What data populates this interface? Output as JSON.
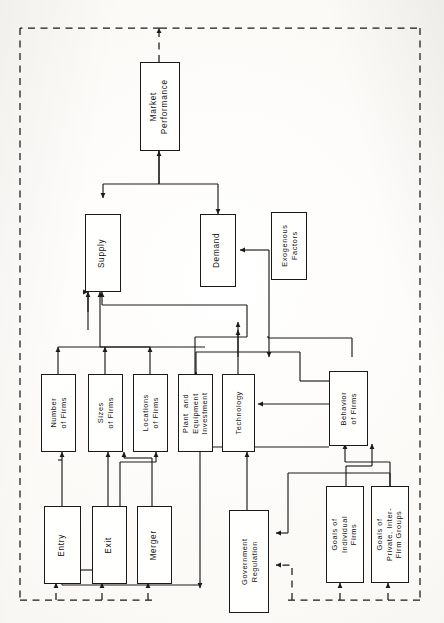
{
  "figure": {
    "type": "flowchart",
    "orientation": "rotated-90-ccw",
    "caption": "Determinants of Market Performance",
    "nodes": [
      {
        "id": "market_performance",
        "label": "Market\nPerformance"
      },
      {
        "id": "supply",
        "label": "Supply"
      },
      {
        "id": "demand",
        "label": "Demand"
      },
      {
        "id": "exogenous_factors",
        "label": "Exogenous\nFactors"
      },
      {
        "id": "number_of_firms",
        "label": "Number\nof Firms"
      },
      {
        "id": "sizes_of_firms",
        "label": "Sizes\nof Firms"
      },
      {
        "id": "locations_of_firms",
        "label": "Locations\nof Firms"
      },
      {
        "id": "plant_equipment_investment",
        "label": "Plant  and\nEquipment\nInvestment"
      },
      {
        "id": "technology",
        "label": "Technology"
      },
      {
        "id": "behavior_of_firms",
        "label": "Behavior\nof Firms"
      },
      {
        "id": "entry",
        "label": "Entry"
      },
      {
        "id": "exit",
        "label": "Exit"
      },
      {
        "id": "merger",
        "label": "Merger"
      },
      {
        "id": "government_regulation",
        "label": "Government\nRegulation"
      },
      {
        "id": "goals_individual_firms",
        "label": "Goals of\nIndividual\nFirms"
      },
      {
        "id": "goals_private_interfirm_groups",
        "label": "Goals of\nPrivate, Inter-\nFirm Groups"
      }
    ],
    "edges": [
      {
        "from": "supply",
        "to": "market_performance",
        "style": "solid"
      },
      {
        "from": "demand",
        "to": "market_performance",
        "style": "solid"
      },
      {
        "from": "exogenous_factors",
        "to": "demand",
        "style": "solid"
      },
      {
        "from": "exogenous_factors",
        "to": "technology",
        "style": "solid"
      },
      {
        "from": "number_of_firms",
        "to": "supply",
        "style": "solid"
      },
      {
        "from": "sizes_of_firms",
        "to": "supply",
        "style": "solid"
      },
      {
        "from": "locations_of_firms",
        "to": "supply",
        "style": "solid"
      },
      {
        "from": "plant_equipment_investment",
        "to": "supply",
        "style": "solid"
      },
      {
        "from": "technology",
        "to": "supply",
        "style": "solid"
      },
      {
        "from": "behavior_of_firms",
        "to": "supply",
        "style": "solid"
      },
      {
        "from": "entry",
        "to": "number_of_firms",
        "style": "solid"
      },
      {
        "from": "entry",
        "to": "sizes_of_firms",
        "style": "solid"
      },
      {
        "from": "exit",
        "to": "sizes_of_firms",
        "style": "solid"
      },
      {
        "from": "merger",
        "to": "sizes_of_firms",
        "style": "solid"
      },
      {
        "from": "merger",
        "to": "locations_of_firms",
        "style": "solid"
      },
      {
        "from": "behavior_of_firms",
        "to": "entry",
        "style": "solid"
      },
      {
        "from": "behavior_of_firms",
        "to": "exit",
        "style": "solid"
      },
      {
        "from": "behavior_of_firms",
        "to": "merger",
        "style": "solid"
      },
      {
        "from": "behavior_of_firms",
        "to": "plant_equipment_investment",
        "style": "solid"
      },
      {
        "from": "behavior_of_firms",
        "to": "technology",
        "style": "solid"
      },
      {
        "from": "goals_individual_firms",
        "to": "behavior_of_firms",
        "style": "solid"
      },
      {
        "from": "goals_private_interfirm_groups",
        "to": "behavior_of_firms",
        "style": "solid"
      },
      {
        "from": "goals_private_interfirm_groups",
        "to": "government_regulation",
        "style": "solid"
      },
      {
        "from": "government_regulation",
        "to": "behavior_of_firms",
        "style": "solid"
      },
      {
        "from": "market_performance",
        "to": "entry",
        "style": "dashed"
      },
      {
        "from": "market_performance",
        "to": "exit",
        "style": "dashed"
      },
      {
        "from": "market_performance",
        "to": "merger",
        "style": "dashed"
      },
      {
        "from": "market_performance",
        "to": "government_regulation",
        "style": "dashed"
      },
      {
        "from": "market_performance",
        "to": "goals_individual_firms",
        "style": "dashed"
      },
      {
        "from": "market_performance",
        "to": "goals_private_interfirm_groups",
        "style": "dashed"
      }
    ]
  },
  "colors": {
    "ink": "#1a1a1a",
    "paper": "#fbfaf7",
    "box_fill": "#fffffe"
  }
}
